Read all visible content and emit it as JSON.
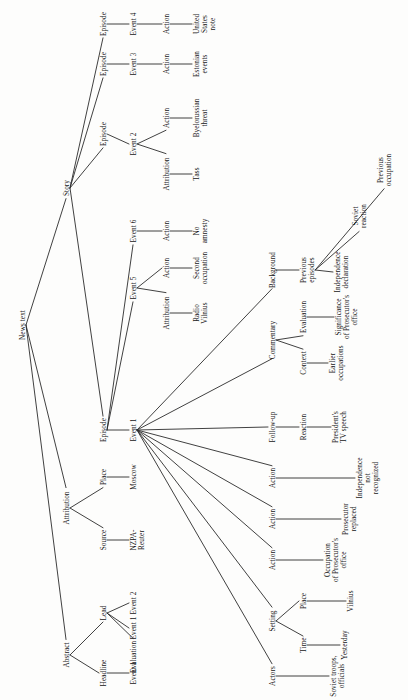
{
  "diagram": {
    "type": "tree",
    "orientation": "rotated-90-counterclockwise",
    "root": "News text",
    "nodes": [
      {
        "id": "news-text",
        "label": "News text",
        "x": 22,
        "y": 325
      },
      {
        "id": "story",
        "label": "Story",
        "x": 66,
        "y": 188
      },
      {
        "id": "attribution-top",
        "label": "Attribution",
        "x": 66,
        "y": 508
      },
      {
        "id": "abstract",
        "label": "Abstract",
        "x": 66,
        "y": 655
      },
      {
        "id": "episode-4",
        "label": "Episode",
        "x": 103,
        "y": 24
      },
      {
        "id": "episode-3",
        "label": "Episode",
        "x": 103,
        "y": 64
      },
      {
        "id": "episode-2",
        "label": "Episode",
        "x": 103,
        "y": 134
      },
      {
        "id": "episode-1",
        "label": "Episode",
        "x": 103,
        "y": 430
      },
      {
        "id": "event-4",
        "label": "Event 4",
        "x": 133,
        "y": 24
      },
      {
        "id": "event-3",
        "label": "Event 3",
        "x": 133,
        "y": 64
      },
      {
        "id": "event-2",
        "label": "Event 2",
        "x": 133,
        "y": 144
      },
      {
        "id": "event-6",
        "label": "Event 6",
        "x": 133,
        "y": 231
      },
      {
        "id": "event-5",
        "label": "Event 5",
        "x": 133,
        "y": 288
      },
      {
        "id": "event-1",
        "label": "Event 1",
        "x": 133,
        "y": 430
      },
      {
        "id": "action-4",
        "label": "Action",
        "x": 166,
        "y": 24
      },
      {
        "id": "action-3",
        "label": "Action",
        "x": 166,
        "y": 64
      },
      {
        "id": "action-2",
        "label": "Action",
        "x": 166,
        "y": 118
      },
      {
        "id": "attribution-2",
        "label": "Attribution",
        "x": 166,
        "y": 174
      },
      {
        "id": "action-6",
        "label": "Action",
        "x": 166,
        "y": 231
      },
      {
        "id": "action-5",
        "label": "Action",
        "x": 166,
        "y": 268
      },
      {
        "id": "attribution-5",
        "label": "Attribution",
        "x": 166,
        "y": 313
      },
      {
        "id": "united-states-note",
        "label": "United\nStates\nnote",
        "x": 196,
        "y": 24
      },
      {
        "id": "estonian-events",
        "label": "Estonian\nevents",
        "x": 196,
        "y": 64
      },
      {
        "id": "byelorussian-threat",
        "label": "Byelorussian\nthreat",
        "x": 196,
        "y": 118
      },
      {
        "id": "tass",
        "label": "Tass",
        "x": 196,
        "y": 174
      },
      {
        "id": "no-amnesty",
        "label": "No\namnesty",
        "x": 196,
        "y": 231
      },
      {
        "id": "second-occupation",
        "label": "Second\noccupation",
        "x": 196,
        "y": 268
      },
      {
        "id": "radio-vilnius",
        "label": "Radio\nVilnius",
        "x": 196,
        "y": 313
      },
      {
        "id": "place",
        "label": "Place",
        "x": 103,
        "y": 477
      },
      {
        "id": "source",
        "label": "Source",
        "x": 103,
        "y": 540
      },
      {
        "id": "moscow",
        "label": "Moscow",
        "x": 133,
        "y": 477
      },
      {
        "id": "nzpa-reuter",
        "label": "NZPA-\nReuter",
        "x": 133,
        "y": 540
      },
      {
        "id": "lead",
        "label": "Lead",
        "x": 103,
        "y": 613
      },
      {
        "id": "headline",
        "label": "Headline",
        "x": 103,
        "y": 673
      },
      {
        "id": "lead-event-2",
        "label": "Event 2",
        "x": 133,
        "y": 603
      },
      {
        "id": "lead-event-1",
        "label": "Event 1",
        "x": 133,
        "y": 628
      },
      {
        "id": "lead-evaluation",
        "label": "Evaluation",
        "x": 133,
        "y": 657
      },
      {
        "id": "headline-event-1",
        "label": "Event 1",
        "x": 133,
        "y": 673
      },
      {
        "id": "background",
        "label": "Background",
        "x": 272,
        "y": 270
      },
      {
        "id": "commentary",
        "label": "Commentary",
        "x": 272,
        "y": 340
      },
      {
        "id": "follow-up",
        "label": "Follow-up",
        "x": 272,
        "y": 427
      },
      {
        "id": "e1-action-a",
        "label": "Action",
        "x": 272,
        "y": 478
      },
      {
        "id": "e1-action-b",
        "label": "Action",
        "x": 272,
        "y": 519
      },
      {
        "id": "e1-action-c",
        "label": "Action",
        "x": 272,
        "y": 560
      },
      {
        "id": "setting",
        "label": "Setting",
        "x": 272,
        "y": 621
      },
      {
        "id": "actors",
        "label": "Actors",
        "x": 272,
        "y": 676
      },
      {
        "id": "previous-episodes",
        "label": "Previous\nepisodes",
        "x": 303,
        "y": 270
      },
      {
        "id": "evaluation",
        "label": "Evaluation",
        "x": 303,
        "y": 317
      },
      {
        "id": "context",
        "label": "Context",
        "x": 303,
        "y": 363
      },
      {
        "id": "reaction",
        "label": "Reaction",
        "x": 303,
        "y": 427
      },
      {
        "id": "place-2",
        "label": "Place",
        "x": 303,
        "y": 601
      },
      {
        "id": "time",
        "label": "Time",
        "x": 303,
        "y": 645
      },
      {
        "id": "independence-declaration",
        "label": "Independence\ndeclaration",
        "x": 337,
        "y": 272
      },
      {
        "id": "soviet-reaction",
        "label": "Soviet\nreaction",
        "x": 355,
        "y": 216
      },
      {
        "id": "previous-occupation",
        "label": "Previous\noccupation",
        "x": 380,
        "y": 170
      },
      {
        "id": "sig-prosecutor-office",
        "label": "Significance\nof Prosecutor's\noffice",
        "x": 338,
        "y": 317
      },
      {
        "id": "earlier-occupations",
        "label": "Earlier\noccupations",
        "x": 332,
        "y": 363
      },
      {
        "id": "presidents-tv-speech",
        "label": "President's\nTV speech",
        "x": 335,
        "y": 427
      },
      {
        "id": "independence-not-recognized",
        "label": "Independence\nnot\nrecognized",
        "x": 359,
        "y": 478
      },
      {
        "id": "prosecutor-replaced",
        "label": "Prosecutor\nreplaced",
        "x": 345,
        "y": 519
      },
      {
        "id": "occupation-prosecutor-office",
        "label": "Occupation\nof Prosecutor's\noffice",
        "x": 327,
        "y": 560
      },
      {
        "id": "vilnius",
        "label": "Vilnius",
        "x": 350,
        "y": 601
      },
      {
        "id": "yesterday",
        "label": "Yesterday",
        "x": 344,
        "y": 645
      },
      {
        "id": "soviet-troops-officials",
        "label": "Soviet troops,\nofficials",
        "x": 333,
        "y": 676
      }
    ],
    "edges": [
      {
        "from": "news-text",
        "to": "story"
      },
      {
        "from": "news-text",
        "to": "attribution-top"
      },
      {
        "from": "news-text",
        "to": "abstract"
      },
      {
        "from": "story",
        "to": "episode-4"
      },
      {
        "from": "story",
        "to": "episode-3"
      },
      {
        "from": "story",
        "to": "episode-2"
      },
      {
        "from": "story",
        "to": "episode-1"
      },
      {
        "from": "episode-4",
        "to": "event-4"
      },
      {
        "from": "episode-3",
        "to": "event-3"
      },
      {
        "from": "episode-2",
        "to": "event-2"
      },
      {
        "from": "episode-1",
        "to": "event-1"
      },
      {
        "from": "episode-1",
        "to": "event-5"
      },
      {
        "from": "episode-1",
        "to": "event-6"
      },
      {
        "from": "event-4",
        "to": "action-4"
      },
      {
        "from": "event-3",
        "to": "action-3"
      },
      {
        "from": "event-2",
        "to": "action-2"
      },
      {
        "from": "event-2",
        "to": "attribution-2"
      },
      {
        "from": "event-6",
        "to": "action-6"
      },
      {
        "from": "event-5",
        "to": "action-5"
      },
      {
        "from": "event-5",
        "to": "attribution-5"
      },
      {
        "from": "action-4",
        "to": "united-states-note"
      },
      {
        "from": "action-3",
        "to": "estonian-events"
      },
      {
        "from": "action-2",
        "to": "byelorussian-threat"
      },
      {
        "from": "attribution-2",
        "to": "tass"
      },
      {
        "from": "action-6",
        "to": "no-amnesty"
      },
      {
        "from": "action-5",
        "to": "second-occupation"
      },
      {
        "from": "attribution-5",
        "to": "radio-vilnius"
      },
      {
        "from": "attribution-top",
        "to": "place"
      },
      {
        "from": "attribution-top",
        "to": "source"
      },
      {
        "from": "place",
        "to": "moscow"
      },
      {
        "from": "source",
        "to": "nzpa-reuter"
      },
      {
        "from": "abstract",
        "to": "lead"
      },
      {
        "from": "abstract",
        "to": "headline"
      },
      {
        "from": "lead",
        "to": "lead-event-2"
      },
      {
        "from": "lead",
        "to": "lead-event-1"
      },
      {
        "from": "lead",
        "to": "lead-evaluation"
      },
      {
        "from": "headline",
        "to": "headline-event-1"
      },
      {
        "from": "event-1",
        "to": "background"
      },
      {
        "from": "event-1",
        "to": "commentary"
      },
      {
        "from": "event-1",
        "to": "follow-up"
      },
      {
        "from": "event-1",
        "to": "e1-action-a"
      },
      {
        "from": "event-1",
        "to": "e1-action-b"
      },
      {
        "from": "event-1",
        "to": "e1-action-c"
      },
      {
        "from": "event-1",
        "to": "setting"
      },
      {
        "from": "event-1",
        "to": "actors"
      },
      {
        "from": "background",
        "to": "previous-episodes"
      },
      {
        "from": "commentary",
        "to": "evaluation"
      },
      {
        "from": "commentary",
        "to": "context"
      },
      {
        "from": "follow-up",
        "to": "reaction"
      },
      {
        "from": "setting",
        "to": "place-2"
      },
      {
        "from": "setting",
        "to": "time"
      },
      {
        "from": "previous-episodes",
        "to": "independence-declaration"
      },
      {
        "from": "previous-episodes",
        "to": "soviet-reaction"
      },
      {
        "from": "previous-episodes",
        "to": "previous-occupation"
      },
      {
        "from": "evaluation",
        "to": "sig-prosecutor-office"
      },
      {
        "from": "context",
        "to": "earlier-occupations"
      },
      {
        "from": "reaction",
        "to": "presidents-tv-speech"
      },
      {
        "from": "e1-action-a",
        "to": "independence-not-recognized"
      },
      {
        "from": "e1-action-b",
        "to": "prosecutor-replaced"
      },
      {
        "from": "e1-action-c",
        "to": "occupation-prosecutor-office"
      },
      {
        "from": "place-2",
        "to": "vilnius"
      },
      {
        "from": "time",
        "to": "yesterday"
      },
      {
        "from": "actors",
        "to": "soviet-troops-officials"
      }
    ],
    "colors": {
      "line": "#2b2b2b",
      "text": "#151515",
      "background": "#fdfdfc"
    }
  }
}
